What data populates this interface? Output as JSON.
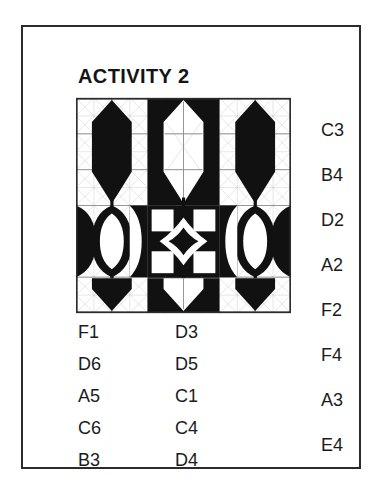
{
  "page": {
    "title": "ACTIVITY 2",
    "border_color": "#2b2b2b",
    "background": "#ffffff",
    "ink_color": "#1b1b1b"
  },
  "pattern": {
    "name": "quilt-block-tessellation",
    "grid_rows": 6,
    "grid_cols": 6,
    "fill_color": "#111111",
    "background_color": "#ffffff",
    "gridline_color": "#9a9a9a",
    "diagonal_color": "#b9b9b9",
    "border_color": "#2b2b2b"
  },
  "labels": {
    "left_column": [
      "F1",
      "D6",
      "A5",
      "C6",
      "B3"
    ],
    "middle_column": [
      "D3",
      "D5",
      "C1",
      "C4",
      "D4"
    ],
    "right_column": [
      "C3",
      "B4",
      "D2",
      "A2",
      "F2",
      "F4",
      "A3",
      "E4"
    ]
  }
}
